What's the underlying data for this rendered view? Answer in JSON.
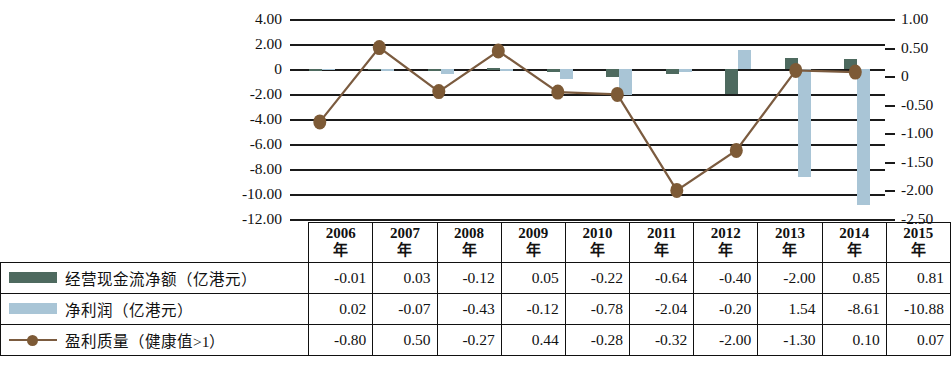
{
  "chart_data": {
    "type": "bar",
    "title": "",
    "xlabel": "",
    "ylabel": "",
    "categories": [
      "2006年",
      "2007年",
      "2008年",
      "2009年",
      "2010年",
      "2011年",
      "2012年",
      "2013年",
      "2014年",
      "2015年"
    ],
    "axis_left": {
      "ticks": [
        "4.00",
        "2.00",
        "0",
        "-2.00",
        "-4.00",
        "-6.00",
        "-8.00",
        "-10.00",
        "-12.00"
      ],
      "values": [
        4.0,
        2.0,
        0,
        -2.0,
        -4.0,
        -6.0,
        -8.0,
        -10.0,
        -12.0
      ],
      "min": -12.0,
      "max": 4.0,
      "step": 2.0
    },
    "axis_right": {
      "ticks": [
        "1.00",
        "0.50",
        "0",
        "-0.50",
        "-1.00",
        "-1.50",
        "-2.00",
        "-2.50"
      ],
      "values": [
        1.0,
        0.5,
        0,
        -0.5,
        -1.0,
        -1.5,
        -2.0,
        -2.5
      ],
      "min": -2.5,
      "max": 1.0,
      "step": 0.5
    },
    "grid": true,
    "legend_position": "table-left-column",
    "series": [
      {
        "name": "经营现金流净额（亿港元）",
        "type": "bar",
        "axis": "left",
        "color": "#4e6a5f",
        "values": [
          -0.01,
          0.03,
          -0.12,
          0.05,
          -0.22,
          -0.64,
          -0.4,
          -2.0,
          0.85,
          0.81
        ]
      },
      {
        "name": "净利润（亿港元）",
        "type": "bar",
        "axis": "left",
        "color": "#a9c5d6",
        "values": [
          0.02,
          -0.07,
          -0.43,
          -0.12,
          -0.78,
          -2.04,
          -0.2,
          1.54,
          -8.61,
          -10.88
        ]
      },
      {
        "name": "盈利质量（健康值>1）",
        "type": "line",
        "axis": "right",
        "color": "#7b5b3f",
        "marker_color": "#7d5a36",
        "values": [
          -0.8,
          0.5,
          -0.27,
          0.44,
          -0.28,
          -0.32,
          -2.0,
          -1.3,
          0.1,
          0.07
        ]
      }
    ]
  },
  "table": {
    "year_headers": [
      {
        "year": "2006",
        "unit": "年"
      },
      {
        "year": "2007",
        "unit": "年"
      },
      {
        "year": "2008",
        "unit": "年"
      },
      {
        "year": "2009",
        "unit": "年"
      },
      {
        "year": "2010",
        "unit": "年"
      },
      {
        "year": "2011",
        "unit": "年"
      },
      {
        "year": "2012",
        "unit": "年"
      },
      {
        "year": "2013",
        "unit": "年"
      },
      {
        "year": "2014",
        "unit": "年"
      },
      {
        "year": "2015",
        "unit": "年"
      }
    ],
    "rows": [
      {
        "label": "经营现金流净额（亿港元）",
        "swatch": "green-bar-swatch",
        "cells": [
          "-0.01",
          "0.03",
          "-0.12",
          "0.05",
          "-0.22",
          "-0.64",
          "-0.40",
          "-2.00",
          "0.85",
          "0.81"
        ]
      },
      {
        "label": "净利润（亿港元）",
        "swatch": "blue-bar-swatch",
        "cells": [
          "0.02",
          "-0.07",
          "-0.43",
          "-0.12",
          "-0.78",
          "-2.04",
          "-0.20",
          "1.54",
          "-8.61",
          "-10.88"
        ]
      },
      {
        "label": "盈利质量（健康值>1）",
        "swatch": "line-marker-swatch",
        "cells": [
          "-0.80",
          "0.50",
          "-0.27",
          "0.44",
          "-0.28",
          "-0.32",
          "-2.00",
          "-1.30",
          "0.10",
          "0.07"
        ]
      }
    ]
  },
  "colors": {
    "operating_cashflow": "#4e6a5f",
    "net_profit": "#a9c5d6",
    "profit_quality_line": "#7b5b3f",
    "grid": "#1a1a1a"
  }
}
